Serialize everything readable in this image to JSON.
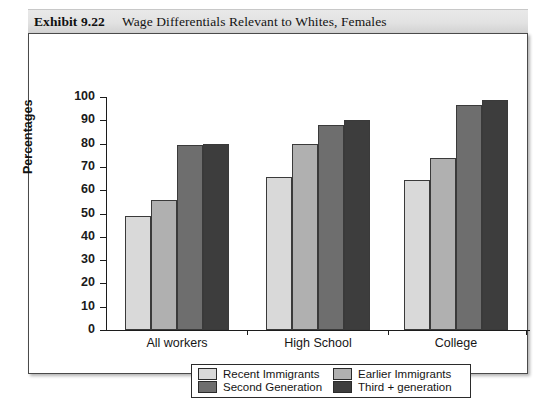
{
  "exhibit": {
    "number": "Exhibit 9.22",
    "title": "Wage Differentials Relevant to Whites, Females"
  },
  "chart_data": {
    "type": "bar",
    "title": "Wage Differentials Relevant to Whites, Females",
    "xlabel": "",
    "ylabel": "Percentages",
    "ylim": [
      0,
      100
    ],
    "ytick_step": 10,
    "yticks": [
      0,
      10,
      20,
      30,
      40,
      50,
      60,
      70,
      80,
      90,
      100
    ],
    "grid": false,
    "legend_position": "bottom",
    "categories": [
      "All workers",
      "High School",
      "College"
    ],
    "series": [
      {
        "name": "Recent Immigrants",
        "color": "#d9d9d9",
        "values": [
          49,
          65.5,
          64.5
        ]
      },
      {
        "name": "Earlier Immigrants",
        "color": "#b0b0b0",
        "values": [
          56,
          80,
          74
        ]
      },
      {
        "name": "Second Generation",
        "color": "#6e6e6e",
        "values": [
          79.5,
          88,
          96.5
        ]
      },
      {
        "name": "Third + generation",
        "color": "#3d3d3d",
        "values": [
          80,
          90,
          98.5
        ]
      }
    ]
  },
  "colors": {
    "recent_immigrants": "#d9d9d9",
    "earlier_immigrants": "#b0b0b0",
    "second_generation": "#6e6e6e",
    "third_plus_generation": "#3d3d3d",
    "axis": "#1c1c1c",
    "frame": "#4a4a4a",
    "title_band": "#e2e2e2"
  }
}
